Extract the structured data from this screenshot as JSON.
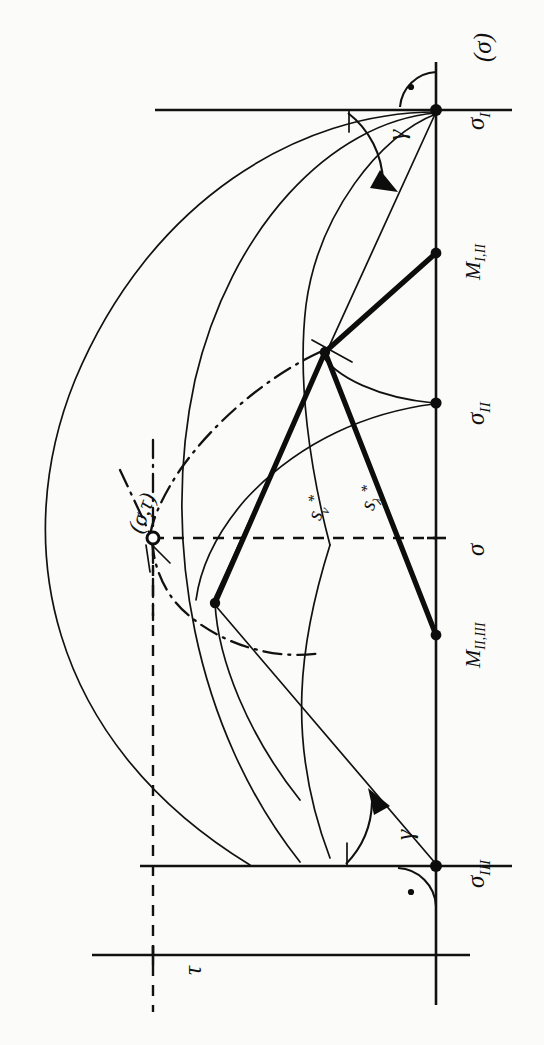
{
  "figure": {
    "kind": "geometric-construction-drawing",
    "orientation": "rotated-90-ccw",
    "ink_color": "#111111",
    "paper_color": "#fbfbf9"
  },
  "labels": {
    "sigma_axis_top": "(σ)",
    "point_g1": "σ",
    "point_g1_sub": "I",
    "point_g2": "σ",
    "point_g2_sub": "II",
    "point_g3": "σ",
    "point_g3_sub": "III",
    "point_m12": "M",
    "point_m12_sub": "I,II",
    "point_m23": "M",
    "point_m23_sub": "II,III",
    "sigma_mid": "σ",
    "center_gt": "(σ,τ)",
    "tau_axis": "τ",
    "gamma_top": "γ",
    "gamma_bottom": "γ",
    "s_nu": "s",
    "s_nu_star": "*",
    "s_nu_sub": "ν",
    "s_lambda": "s",
    "s_lambda_star": "*",
    "s_lambda_sub": "λ"
  },
  "points": {
    "g1": {
      "x": 436,
      "y": 110,
      "marker": "dot"
    },
    "m12": {
      "x": 436,
      "y": 253,
      "marker": "dot"
    },
    "g2": {
      "x": 436,
      "y": 403,
      "marker": "dot"
    },
    "sigma_tick": {
      "x": 436,
      "y": 538,
      "marker": "tick"
    },
    "m23": {
      "x": 436,
      "y": 635,
      "marker": "dot"
    },
    "g3": {
      "x": 436,
      "y": 866,
      "marker": "dot"
    },
    "node_upper": {
      "x": 325,
      "y": 352,
      "marker": "node"
    },
    "node_lower": {
      "x": 215,
      "y": 603,
      "marker": "node"
    },
    "center": {
      "x": 153,
      "y": 538,
      "marker": "ring"
    },
    "tau_origin": {
      "x": 153,
      "y": 955,
      "marker": "tick"
    }
  },
  "geometry": {
    "vertical_axis": {
      "x": 436,
      "y1": 62,
      "y2": 1005
    },
    "top_horizontal": {
      "y": 110,
      "x1": 155,
      "x2": 512
    },
    "bottom_horizontal": {
      "y": 866,
      "x1": 140,
      "x2": 512
    },
    "tau_baseline": {
      "y": 955,
      "x1": 92,
      "x2": 470
    },
    "dashed_horizontal": {
      "y": 538,
      "x1": 153,
      "x2": 436
    },
    "dashed_vertical": {
      "x": 153,
      "y1": 538,
      "y2": 1010
    }
  },
  "angles": {
    "gamma_top_vertex": {
      "x": 436,
      "y": 110
    },
    "gamma_bottom_vertex": {
      "x": 436,
      "y": 866
    },
    "right_angle_marks": 2
  },
  "segments": {
    "thick_polyline_upper": "m12 -> node_upper -> node_lower",
    "thick_polyline_lower": "node_upper -> m23",
    "thin_ray_g1": "g1 -> node_lower (through node_upper region)",
    "thin_ray_g3": "g3 -> node_lower"
  }
}
